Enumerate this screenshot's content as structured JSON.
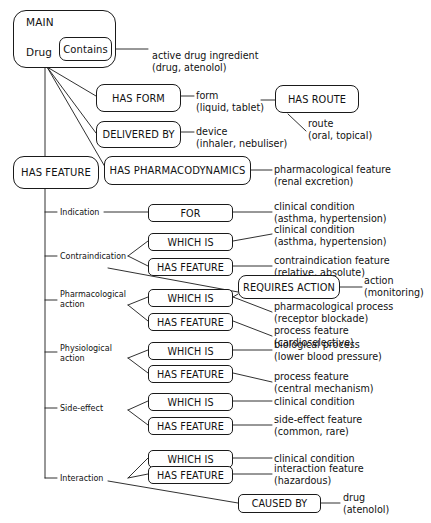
{
  "diagram": {
    "root": {
      "container_label": "MAIN",
      "entity_label": "Drug",
      "relation_label": "Contains",
      "relation_value": "active drug ingredient\n(drug, atenolol)"
    },
    "top_relations": [
      {
        "name": "has-form",
        "label": "HAS FORM",
        "value": "form\n(liquid, tablet)"
      },
      {
        "name": "has-route",
        "label": "HAS ROUTE",
        "value": "route\n(oral, topical)"
      },
      {
        "name": "delivered-by",
        "label": "DELIVERED BY",
        "value": "device\n(inhaler, nebuliser)"
      },
      {
        "name": "has-feature",
        "label": "HAS FEATURE",
        "value": ""
      },
      {
        "name": "has-pharmacodynamics",
        "label": "HAS PHARMACODYNAMICS",
        "value": "pharmacological feature\n(renal excretion)"
      }
    ],
    "feature_branches": [
      {
        "name": "indication",
        "label": "Indication",
        "rows": [
          {
            "label": "FOR",
            "value": "clinical condition\n(asthma, hypertension)"
          }
        ]
      },
      {
        "name": "contraindication",
        "label": "Contraindication",
        "rows": [
          {
            "label": "WHICH IS",
            "value": "clinical condition\n(asthma, hypertension)"
          },
          {
            "label": "HAS FEATURE",
            "value": "contraindication feature\n(relative, absolute)"
          }
        ]
      },
      {
        "name": "pharmacological-action",
        "label": "Pharmacological\naction",
        "rows": [
          {
            "label": "WHICH IS",
            "value": "pharmacological process\n(receptor blockade)"
          },
          {
            "label": "HAS FEATURE",
            "value": "process feature\n(cardioselective)"
          }
        ]
      },
      {
        "name": "physiological-action",
        "label": "Physiological\naction",
        "rows": [
          {
            "label": "WHICH IS",
            "value": "biological process\n(lower blood pressure)"
          },
          {
            "label": "HAS FEATURE",
            "value": "process feature\n(central mechanism)"
          }
        ]
      },
      {
        "name": "side-effect",
        "label": "Side-effect",
        "rows": [
          {
            "label": "WHICH IS",
            "value": "clinical condition"
          },
          {
            "label": "HAS FEATURE",
            "value": "side-effect feature\n(common, rare)"
          }
        ]
      },
      {
        "name": "interaction",
        "label": "Interaction",
        "rows": [
          {
            "label": "WHICH IS",
            "value": "clinical condition"
          },
          {
            "label": "HAS FEATURE",
            "value": "interaction feature\n(hazardous)"
          }
        ]
      }
    ],
    "cross_relations": [
      {
        "name": "requires-action",
        "label": "REQUIRES ACTION",
        "value": "action\n(monitoring)"
      },
      {
        "name": "caused-by",
        "label": "CAUSED  BY",
        "value": "drug\n(atenolol)"
      }
    ],
    "colors": {
      "stroke": "#1a1a1a",
      "text": "#111111",
      "background": "#ffffff"
    }
  }
}
